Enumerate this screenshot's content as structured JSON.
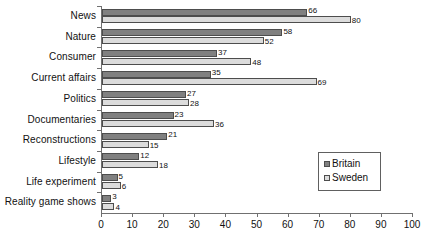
{
  "chart_data": {
    "type": "bar",
    "orientation": "horizontal",
    "title": "",
    "xlabel": "",
    "ylabel": "",
    "categories": [
      "News",
      "Nature",
      "Consumer",
      "Current affairs",
      "Politics",
      "Documentaries",
      "Reconstructions",
      "Lifestyle",
      "Life experiment",
      "Reality game shows"
    ],
    "series": [
      {
        "name": "Britain",
        "color": "#808080",
        "values": [
          66,
          58,
          37,
          35,
          27,
          23,
          21,
          12,
          5,
          3
        ]
      },
      {
        "name": "Sweden",
        "color": "#dcdcdc",
        "values": [
          80,
          52,
          48,
          69,
          28,
          36,
          15,
          18,
          6,
          4
        ]
      }
    ],
    "xlim": [
      0,
      100
    ],
    "xticks": [
      0,
      10,
      20,
      30,
      40,
      50,
      60,
      70,
      80,
      90,
      100
    ],
    "xtick_labels": [
      "0",
      "10",
      "20",
      "30",
      "40",
      "50",
      "60",
      "70",
      "80",
      "90",
      "100"
    ],
    "grid": false,
    "legend_position": "center-right",
    "data_labels": true
  },
  "legend": {
    "items": [
      {
        "label": "Britain",
        "swatch": "britain-swatch"
      },
      {
        "label": "Sweden",
        "swatch": "sweden-swatch"
      }
    ]
  }
}
